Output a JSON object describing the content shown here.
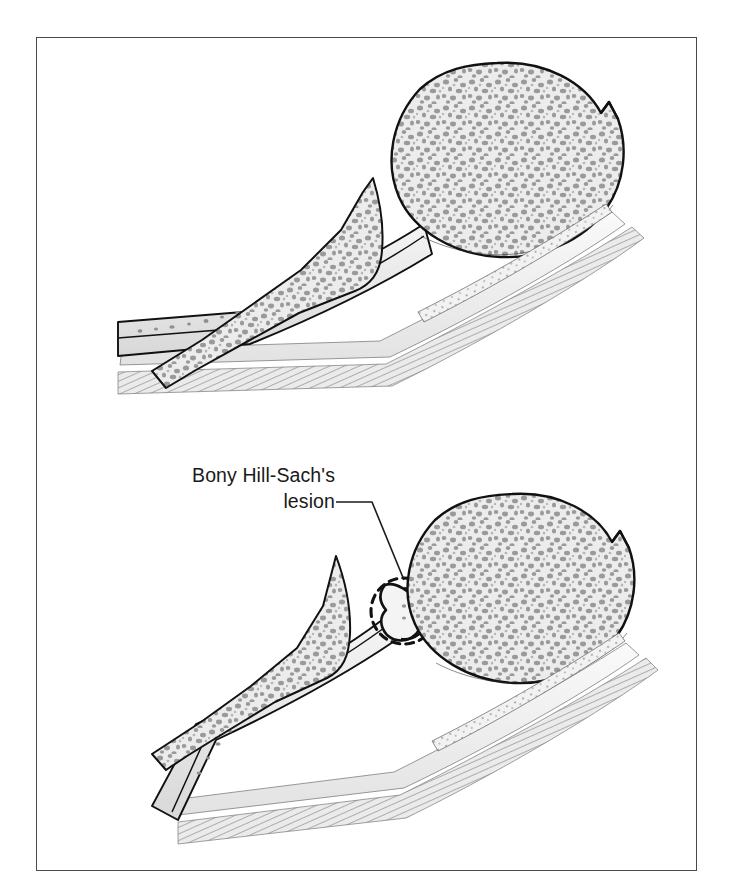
{
  "figure": {
    "kind": "anatomical-illustration",
    "frame": {
      "border_color": "#4a4a4a",
      "background": "#ffffff",
      "x": 36,
      "y": 37,
      "width": 661,
      "height": 834
    },
    "annotation": {
      "label_text": "Bony Hill-Sach's\nlesion",
      "line1": "Bony Hill-Sach's",
      "line2": "lesion",
      "text_color": "#1a1a1a",
      "font_size_px": 19.5,
      "align": "right",
      "leader_line": {
        "from_x": 336,
        "from_y": 502,
        "elbow_x": 372,
        "elbow_y": 502,
        "to_x": 404,
        "to_y": 589,
        "color": "#1a1a1a"
      }
    },
    "caption_fragment": {
      "visible": true,
      "note": "caption text cropped at right page edge",
      "lines": [
        "",
        "",
        ""
      ]
    }
  },
  "palette": {
    "outline": "#111111",
    "cancellous_fill": "#ececec",
    "trabeculae": "#979797",
    "cortex_fill": "#e4e4e4",
    "muscle_hatch": "#8d8d8d",
    "tendon_fill": "#f0f0f0",
    "frame": "#4a4a4a",
    "paper": "#ffffff"
  },
  "panels": [
    {
      "id": "normal-humerus",
      "name": "Normal proximal humerus",
      "position": "upper",
      "structures": [
        {
          "name": "humeral-head",
          "shape": "round",
          "center": [
            497,
            160
          ],
          "radius": 97,
          "fill": "cancellous",
          "has_trabeculae": true
        },
        {
          "name": "head-notch",
          "description": "superior-lateral notch at anatomical neck"
        },
        {
          "name": "greater-tuberosity",
          "shape": "triangular-spike",
          "apex": [
            373,
            178
          ],
          "fill": "cancellous",
          "has_trabeculae": true
        },
        {
          "name": "humeral-shaft",
          "orientation": "diagonal-down-left",
          "fill": "cortex"
        },
        {
          "name": "muscle-striations",
          "count": 9,
          "color": "#8d8d8d"
        },
        {
          "name": "tendon-sheet",
          "fill": "tendon"
        }
      ],
      "lesion_present": false
    },
    {
      "id": "hill-sachs-humerus",
      "name": "Proximal humerus with bony Hill-Sachs lesion",
      "position": "lower",
      "structures": [
        {
          "name": "humeral-head",
          "shape": "round",
          "center": [
            510,
            591
          ],
          "radius": 95,
          "fill": "cancellous",
          "has_trabeculae": true
        },
        {
          "name": "head-notch",
          "description": "superior-lateral notch at anatomical neck"
        },
        {
          "name": "greater-tuberosity",
          "shape": "triangular-spike",
          "apex": [
            336,
            556
          ],
          "fill": "cancellous",
          "has_trabeculae": true
        },
        {
          "name": "hill-sachs-defect",
          "description": "compression notch in posterolateral head",
          "center": [
            404,
            611
          ]
        },
        {
          "name": "dashed-highlight-circle",
          "center": [
            404,
            611
          ],
          "radius": 33,
          "stroke": "#111111",
          "dash": "7 5"
        },
        {
          "name": "humeral-shaft",
          "orientation": "diagonal-down-left",
          "fill": "cortex"
        },
        {
          "name": "muscle-striations",
          "count": 9,
          "color": "#8d8d8d"
        },
        {
          "name": "tendon-sheet",
          "fill": "tendon"
        }
      ],
      "lesion_present": true
    }
  ]
}
